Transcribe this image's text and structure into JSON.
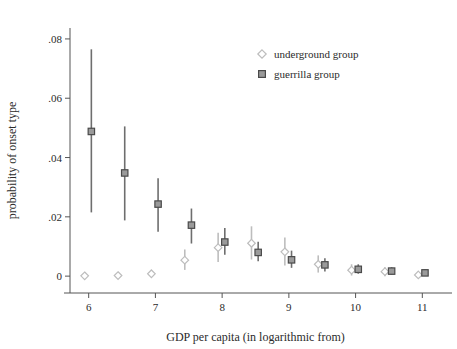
{
  "chart_data": {
    "type": "scatter",
    "title": "",
    "xlabel": "GDP per capita (in logarithmic from)",
    "ylabel": "probability of onset type",
    "xlim": [
      5.72,
      11.28
    ],
    "ylim": [
      -0.004,
      0.082
    ],
    "grid": false,
    "legend_position": "top-right",
    "x": [
      6,
      6.5,
      7,
      7.5,
      8,
      8.5,
      9,
      9.5,
      10,
      10.5,
      11
    ],
    "xticks": [
      6,
      7,
      8,
      9,
      10,
      11
    ],
    "xtick_labels": [
      "6",
      "7",
      "8",
      "9",
      "10",
      "11"
    ],
    "yticks": [
      0,
      0.02,
      0.04,
      0.06,
      0.08
    ],
    "ytick_labels": [
      "0",
      ".02",
      ".04",
      ".06",
      ".08"
    ],
    "series": [
      {
        "name": "underground group",
        "marker": "diamond",
        "color": "#bdbdbd",
        "x_offset": -0.06,
        "values": [
          0.0001,
          0.0002,
          0.0008,
          0.0054,
          0.0096,
          0.0111,
          0.0082,
          0.004,
          0.002,
          0.0015,
          0.0004
        ],
        "ci_low": [
          0.0,
          0.0,
          0.0,
          0.0021,
          0.0048,
          0.0056,
          0.0036,
          0.0012,
          0.0002,
          0.0,
          0.0
        ],
        "ci_high": [
          0.0002,
          0.0005,
          0.0018,
          0.009,
          0.0146,
          0.0168,
          0.013,
          0.007,
          0.004,
          0.003,
          0.0012
        ]
      },
      {
        "name": "guerrilla group",
        "marker": "square",
        "color": "#6e6e6e",
        "x_offset": 0.04,
        "values": [
          0.0488,
          0.0348,
          0.0243,
          0.0172,
          0.0115,
          0.008,
          0.0055,
          0.0038,
          0.0023,
          0.0017,
          0.0011
        ],
        "ci_low": [
          0.0215,
          0.0188,
          0.015,
          0.011,
          0.0072,
          0.005,
          0.0028,
          0.0016,
          0.0008,
          0.0006,
          0.0002
        ],
        "ci_high": [
          0.0765,
          0.0505,
          0.033,
          0.0228,
          0.0162,
          0.0116,
          0.0086,
          0.006,
          0.004,
          0.003,
          0.0022
        ]
      }
    ]
  },
  "legend": {
    "items": [
      {
        "label": "underground group",
        "marker": "diamond",
        "color": "#bdbdbd"
      },
      {
        "label": "guerrilla group",
        "marker": "square",
        "color": "#6e6e6e"
      }
    ]
  },
  "axes": {
    "x_title": "GDP per capita (in logarithmic from)",
    "y_title": "probability of onset type"
  }
}
